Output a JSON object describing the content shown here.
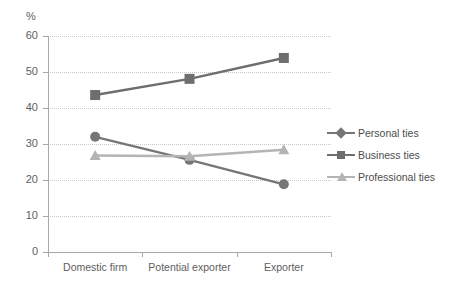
{
  "chart_data": {
    "type": "line",
    "title": "",
    "subtitle": "",
    "xlabel": "",
    "ylabel": "%",
    "unit_label": "%",
    "categories": [
      "Domestic firm",
      "Potential exporter",
      "Exporter"
    ],
    "series": [
      {
        "name": "Personal ties",
        "values": [
          32,
          25.6,
          18.8
        ],
        "color": "#767676",
        "marker": "diamond"
      },
      {
        "name": "Business ties",
        "values": [
          43.6,
          48.1,
          53.9
        ],
        "color": "#6e6e6e",
        "marker": "square"
      },
      {
        "name": "Professional ties",
        "values": [
          26.8,
          26.6,
          28.4
        ],
        "color": "#b4b4b4",
        "marker": "triangle"
      }
    ],
    "ylim": [
      0,
      60
    ],
    "ytick_labels": [
      "0",
      "10",
      "20",
      "30",
      "40",
      "50",
      "60"
    ],
    "ytick_values": [
      0,
      10,
      20,
      30,
      40,
      50,
      60
    ],
    "grid": true,
    "grid_style": "dotted-horizontal",
    "legend_position": "right",
    "legend": [
      "Personal ties",
      "Business ties",
      "Professional ties"
    ]
  },
  "axis": {
    "line_color": "#a8a8a8",
    "grid_color": "#c9c9c9",
    "text_color": "#5e5e5e"
  }
}
